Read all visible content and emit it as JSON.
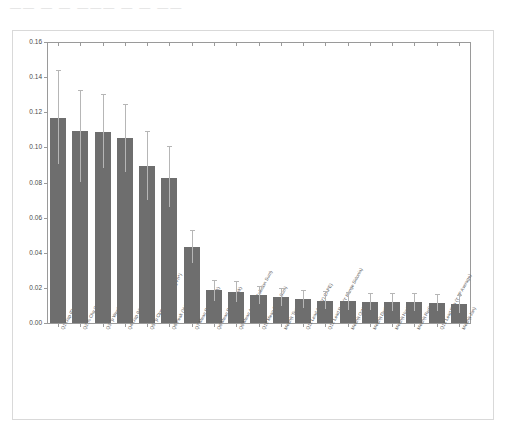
{
  "page": {
    "top_strip_text": "——  — — ——— — — ——",
    "background_color": "#ffffff",
    "frame_color": "#d9d9d9"
  },
  "chart_data": {
    "type": "bar",
    "title": "",
    "subtitle": "",
    "xlabel": "",
    "ylabel": "",
    "ylim": [
      0.0,
      0.16
    ],
    "grid": false,
    "legend": null,
    "bar_color": "#6e6e6e",
    "error_bar_color": "#b6b6b6",
    "axis_color": "#9a9a9a",
    "ytick_labels": [
      "0.00",
      "0.02",
      "0.04",
      "0.06",
      "0.08",
      "0.10",
      "0.12",
      "0.14",
      "0.16"
    ],
    "ytick_values": [
      0.0,
      0.02,
      0.04,
      0.06,
      0.08,
      0.1,
      0.12,
      0.14,
      0.16
    ],
    "categories": [
      "Q1 Gap (Dec Fn^)",
      "Q2 % Chg Opening",
      "Q3 ^p Week Change^",
      "Q4 Gap (Hist Fn^)",
      "Q5 ^p Close to Open Chg Fn^)",
      "Q6 Peak (Volume Fn^)",
      "Q7 Mean Dur ('t' Trunk)",
      "Q8 Mean Dur ('t' Week)",
      "Q9 Mean Avg ('t') Collision Sum)",
      "Q10 Mean Dur ('t' Sum)",
      "Mean(t 'Sum')",
      "Q11 Lead Avg ('t') CAPE)",
      "Q12 Lead Rep ('t' Range Sidonia)",
      "Mean(t Oct)",
      "Mean(t Dec)",
      "Mean(t Nov)",
      "Mean(t Red)",
      "Q13 Lead Rep ('t' JP Average)",
      "Mean(t Jan)"
    ],
    "values": [
      0.117,
      0.1095,
      0.1085,
      0.1055,
      0.0895,
      0.0825,
      0.0435,
      0.0188,
      0.0178,
      0.0158,
      0.0148,
      0.0135,
      0.0128,
      0.0125,
      0.0122,
      0.012,
      0.0118,
      0.0115,
      0.0108
    ],
    "error_upper": [
      0.144,
      0.1325,
      0.1305,
      0.1245,
      0.1095,
      0.1005,
      0.053,
      0.0245,
      0.0238,
      0.0208,
      0.0198,
      0.0188,
      0.018,
      0.0175,
      0.0172,
      0.017,
      0.0168,
      0.0166,
      0.016
    ],
    "error_lower": [
      0.0905,
      0.0805,
      0.088,
      0.086,
      0.07,
      0.066,
      0.034,
      0.0128,
      0.012,
      0.0108,
      0.0098,
      0.0085,
      0.0078,
      0.0075,
      0.0072,
      0.007,
      0.0068,
      0.0066,
      0.0058
    ]
  }
}
